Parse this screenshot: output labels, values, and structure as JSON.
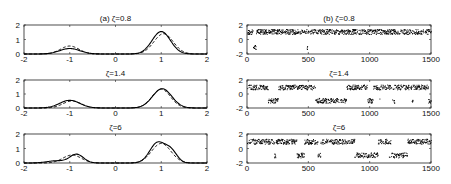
{
  "chart_data": [
    {
      "type": "line",
      "panel": "a",
      "title": "(a) ζ=0.8",
      "xlim": [
        -2,
        2
      ],
      "ylim": [
        0,
        2
      ],
      "xticks": [
        -2,
        -1,
        0,
        1,
        2
      ],
      "yticks": [
        0,
        1,
        2
      ],
      "grid": false,
      "series": [
        {
          "name": "solid",
          "style": "solid",
          "modes": [
            {
              "mu": -1.0,
              "h": 0.38,
              "s": 0.22
            },
            {
              "mu": 1.0,
              "h": 1.55,
              "s": 0.2
            }
          ]
        },
        {
          "name": "dashed",
          "style": "dashed",
          "modes": [
            {
              "mu": -1.0,
              "h": 0.55,
              "s": 0.2
            },
            {
              "mu": 1.05,
              "h": 1.4,
              "s": 0.21
            }
          ]
        }
      ]
    },
    {
      "type": "line",
      "panel": "a",
      "title": "ζ=1.4",
      "xlim": [
        -2,
        2
      ],
      "ylim": [
        0,
        2
      ],
      "xticks": [
        -2,
        -1,
        0,
        1,
        2
      ],
      "yticks": [
        0,
        1,
        2
      ],
      "grid": false,
      "series": [
        {
          "name": "solid",
          "style": "solid",
          "modes": [
            {
              "mu": -1.0,
              "h": 0.55,
              "s": 0.22
            },
            {
              "mu": 1.02,
              "h": 1.38,
              "s": 0.21
            }
          ]
        },
        {
          "name": "dashed",
          "style": "dashed",
          "modes": [
            {
              "mu": -0.95,
              "h": 0.5,
              "s": 0.2
            },
            {
              "mu": 1.0,
              "h": 1.35,
              "s": 0.2
            }
          ]
        }
      ]
    },
    {
      "type": "line",
      "panel": "a",
      "title": "ζ=6",
      "xlim": [
        -2,
        2
      ],
      "ylim": [
        0,
        2
      ],
      "xticks": [
        -2,
        -1,
        0,
        1,
        2
      ],
      "yticks": [
        0,
        1,
        2
      ],
      "grid": false,
      "series": [
        {
          "name": "solid",
          "style": "solid",
          "modes": [
            {
              "mu": -0.85,
              "h": 0.6,
              "s": 0.15
            },
            {
              "mu": -1.3,
              "h": 0.15,
              "s": 0.2
            },
            {
              "mu": 0.92,
              "h": 1.4,
              "s": 0.17
            },
            {
              "mu": 1.22,
              "h": 0.75,
              "s": 0.13
            }
          ]
        },
        {
          "name": "dashed",
          "style": "dashed",
          "modes": [
            {
              "mu": -0.95,
              "h": 0.55,
              "s": 0.2
            },
            {
              "mu": 1.0,
              "h": 1.35,
              "s": 0.21
            }
          ]
        }
      ]
    },
    {
      "type": "scatter",
      "panel": "b",
      "title": "(b) ζ=0.8",
      "xlim": [
        0,
        1500
      ],
      "ylim": [
        -2,
        2
      ],
      "xticks": [
        0,
        500,
        1000,
        1500
      ],
      "yticks": [
        -2,
        0,
        2
      ],
      "grid": false,
      "upper_level": 1.1,
      "lower_level": -1.0,
      "lower_fraction": 0.12,
      "seed": 11
    },
    {
      "type": "scatter",
      "panel": "b",
      "title": "ζ=1.4",
      "xlim": [
        0,
        1500
      ],
      "ylim": [
        -2,
        2
      ],
      "xticks": [
        0,
        500,
        1000,
        1500
      ],
      "yticks": [
        -2,
        0,
        2
      ],
      "grid": false,
      "upper_level": 1.0,
      "lower_level": -0.9,
      "lower_fraction": 0.35,
      "seed": 23
    },
    {
      "type": "scatter",
      "panel": "b",
      "title": "ζ=6",
      "xlim": [
        0,
        1500
      ],
      "ylim": [
        -2,
        2
      ],
      "xticks": [
        0,
        500,
        1000,
        1500
      ],
      "yticks": [
        -2,
        0,
        2
      ],
      "grid": false,
      "upper_level": 1.0,
      "lower_level": -0.9,
      "lower_fraction": 0.3,
      "seed": 37
    }
  ],
  "layout": {
    "left_x": [
      24,
      207
    ],
    "right_x": [
      247,
      431
    ],
    "rows_y": [
      [
        25,
        54
      ],
      [
        80,
        108
      ],
      [
        134,
        163
      ]
    ]
  }
}
